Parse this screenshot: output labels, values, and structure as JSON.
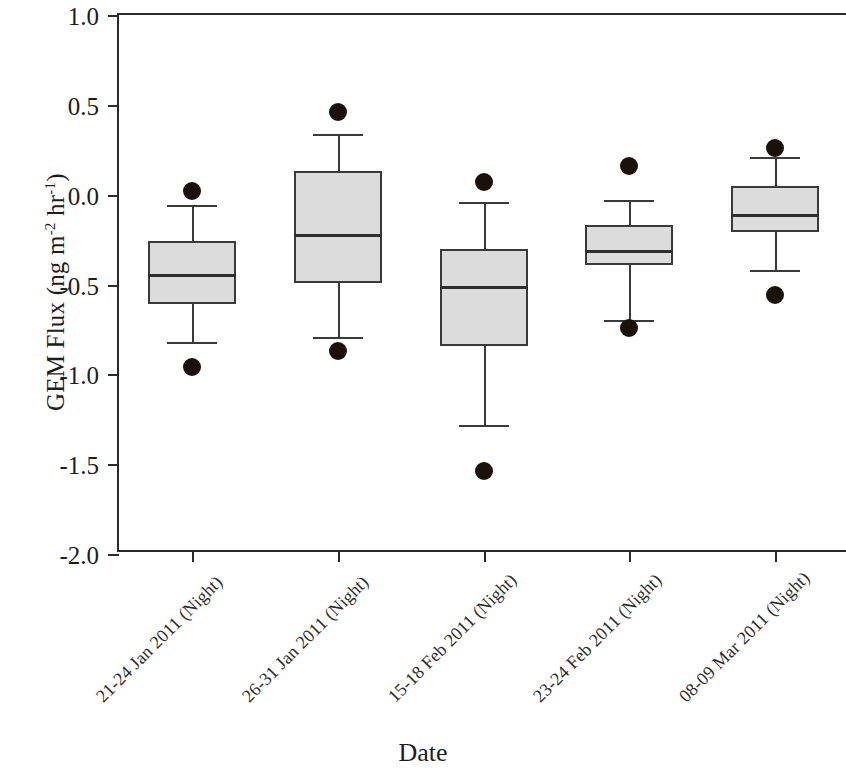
{
  "chart_data": {
    "type": "box",
    "title": "",
    "xlabel": "Date",
    "ylabel": "GEM Flux (ng m⁻² hr⁻¹)",
    "ylabel_parts": {
      "prefix": "GEM Flux (ng m",
      "exp1": "-2",
      "mid": " hr",
      "exp2": "-1",
      "suffix": ")"
    },
    "ylim": [
      -2.0,
      1.0
    ],
    "ytick_values": [
      1.0,
      0.5,
      0.0,
      -0.5,
      -1.0,
      -1.5,
      -2.0
    ],
    "ytick_labels": [
      "1.0",
      "0.5",
      "0.0",
      "-0.5",
      "-1.0",
      "-1.5",
      "-2.0"
    ],
    "grid": false,
    "legend": false,
    "categories": [
      "21-24 Jan 2011 (Night)",
      "26-31 Jan 2011 (Night)",
      "15-18 Feb 2011 (Night)",
      "23-24 Feb 2011 (Night)",
      "08-09 Mar 2011 (Night)"
    ],
    "boxes": [
      {
        "category": "21-24 Jan 2011 (Night)",
        "whisker_low": -0.82,
        "q1": -0.61,
        "median": -0.44,
        "q3": -0.26,
        "whisker_high": -0.06,
        "outliers": [
          0.02,
          -0.96
        ]
      },
      {
        "category": "26-31 Jan 2011 (Night)",
        "whisker_low": -0.79,
        "q1": -0.49,
        "median": -0.22,
        "q3": 0.13,
        "whisker_high": 0.34,
        "outliers": [
          0.46,
          -0.87
        ]
      },
      {
        "category": "15-18 Feb 2011 (Night)",
        "whisker_low": -1.28,
        "q1": -0.84,
        "median": -0.51,
        "q3": -0.3,
        "whisker_high": -0.04,
        "outliers": [
          0.07,
          -1.54
        ]
      },
      {
        "category": "23-24 Feb 2011 (Night)",
        "whisker_low": -0.7,
        "q1": -0.39,
        "median": -0.31,
        "q3": -0.17,
        "whisker_high": -0.03,
        "outliers": [
          0.16,
          -0.74
        ]
      },
      {
        "category": "08-09 Mar 2011 (Night)",
        "whisker_low": -0.42,
        "q1": -0.21,
        "median": -0.11,
        "q3": 0.05,
        "whisker_high": 0.21,
        "outliers": [
          0.26,
          -0.56
        ]
      }
    ],
    "style": {
      "box_fill": "#dcdcdc",
      "box_edge": "#3a3a3a",
      "median_color": "#2e2e2e",
      "outlier_color": "#1a1208",
      "axis_color": "#2a2a2a"
    }
  }
}
